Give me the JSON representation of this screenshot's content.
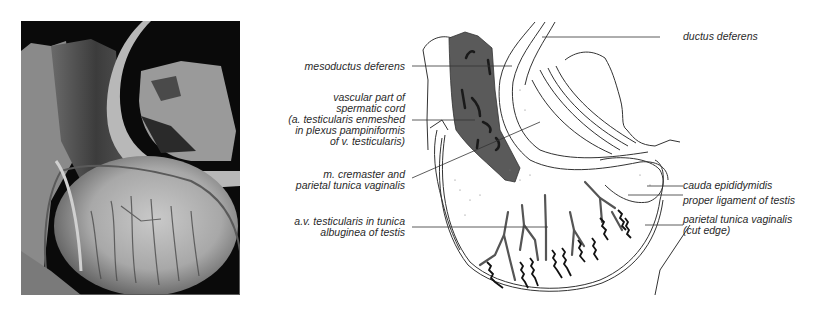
{
  "figure": {
    "photo": {
      "description": "dissection photograph",
      "icon": "photo-specimen"
    },
    "drawing": {
      "description": "labeled schematic drawing of testis and spermatic cord"
    },
    "labels_left": [
      {
        "id": "mesoductus",
        "lines": [
          "mesoductus deferens"
        ]
      },
      {
        "id": "vascular",
        "lines": [
          "vascular part of",
          "spermatic cord",
          "(a. testicularis enmeshed",
          "in plexus pampiniformis",
          "of v. testicularis)"
        ]
      },
      {
        "id": "cremaster",
        "lines": [
          "m. cremaster and",
          "parietal tunica vaginalis"
        ]
      },
      {
        "id": "av",
        "lines": [
          "a.v. testicularis in tunica",
          "albuginea of testis"
        ]
      }
    ],
    "labels_right": [
      {
        "id": "ductus",
        "lines": [
          "ductus deferens"
        ]
      },
      {
        "id": "cauda",
        "lines": [
          "cauda epididymidis"
        ]
      },
      {
        "id": "ligament",
        "lines": [
          "proper ligament of testis"
        ]
      },
      {
        "id": "parietal",
        "lines": [
          "parietal tunica vaginalis",
          "(cut edge)"
        ]
      }
    ],
    "colors": {
      "cord_fill": "#5a5a5a",
      "line": "#333333",
      "vessel_dark": "#1a1a1a",
      "vessel_grey": "#555555"
    }
  }
}
